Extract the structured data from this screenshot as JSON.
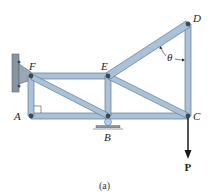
{
  "figure": {
    "caption": "(a)",
    "angle_label": "θ",
    "load_label": "P",
    "colors": {
      "member_fill": "#a9c2d8",
      "member_edge": "#5e7a92",
      "joint": "#3c4a58",
      "wall": "#8a95a0",
      "arrow": "#1a1a1a"
    }
  },
  "joints": [
    {
      "name": "A",
      "x": 31,
      "y": 116
    },
    {
      "name": "B",
      "x": 108,
      "y": 116
    },
    {
      "name": "C",
      "x": 188,
      "y": 116
    },
    {
      "name": "D",
      "x": 188,
      "y": 24
    },
    {
      "name": "E",
      "x": 108,
      "y": 76
    },
    {
      "name": "F",
      "x": 31,
      "y": 76
    }
  ],
  "labels": {
    "A": "A",
    "B": "B",
    "C": "C",
    "D": "D",
    "E": "E",
    "F": "F"
  },
  "members": [
    "FE",
    "FA",
    "FB",
    "AB",
    "BC",
    "EB",
    "EC",
    "ED",
    "DC"
  ],
  "supports": {
    "F": "pin to wall",
    "B": "roller"
  }
}
